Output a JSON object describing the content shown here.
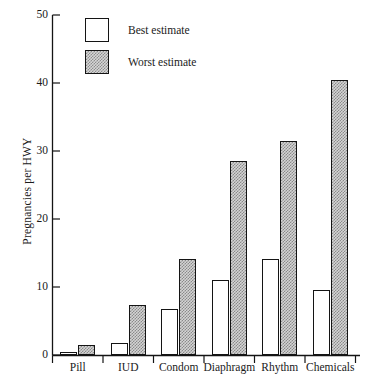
{
  "chart_data": {
    "type": "bar",
    "title": "",
    "xlabel": "",
    "ylabel": "Pregnancies per HWY",
    "categories": [
      "Pill",
      "IUD",
      "Condom",
      "Diaphragm",
      "Rhythm",
      "Chemicals"
    ],
    "series": [
      {
        "name": "Best estimate",
        "values": [
          0.5,
          1.9,
          6.8,
          11.1,
          14.2,
          9.6
        ]
      },
      {
        "name": "Worst estimate",
        "values": [
          1.6,
          7.4,
          14.2,
          28.6,
          31.5,
          40.4
        ]
      }
    ],
    "ylim": [
      0,
      50
    ],
    "yticks": [
      0,
      10,
      20,
      30,
      40,
      50
    ],
    "ytick_labels": [
      "0",
      "10",
      "20",
      "30",
      "40",
      "50"
    ],
    "grid": false,
    "legend_position": "top-left-inside"
  },
  "legend": {
    "entries": [
      {
        "label": "Best estimate",
        "swatch": "white-square"
      },
      {
        "label": "Worst estimate",
        "swatch": "gray-hatched-square"
      }
    ]
  },
  "colors": {
    "axis": "#141414",
    "bar_best_fill": "#ffffff",
    "bar_worst_fill": "#d4d4d4",
    "bar_outline": "#141414",
    "background": "#ffffff"
  }
}
